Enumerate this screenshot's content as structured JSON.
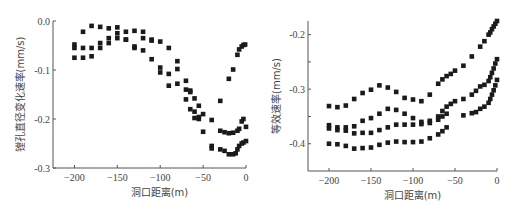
{
  "chart_data": [
    {
      "type": "scatter",
      "title": "",
      "xlabel": "洞口距离(m)",
      "ylabel": "镗孔直径变化速率(mm/s)",
      "xlim": [
        -225,
        0
      ],
      "ylim": [
        -0.3,
        0.0
      ],
      "xticks": [
        -200,
        -150,
        -100,
        -50,
        0
      ],
      "xtick_labels": [
        "-200",
        "-150",
        "-100",
        "-50",
        "0"
      ],
      "yticks": [
        0.0,
        -0.1,
        -0.2,
        -0.3
      ],
      "ytick_labels": [
        "0.0",
        "-0.1",
        "-0.2",
        "-0.3"
      ],
      "grid": false,
      "legend": null,
      "marker": "square",
      "series": [
        {
          "name": "series-1",
          "x": [
            -200,
            -190,
            -180,
            -170,
            -160,
            -150,
            -140,
            -130,
            -120,
            -110,
            -100,
            -90,
            -80,
            -70,
            -65,
            -60,
            -55,
            -50,
            -40,
            -30,
            -20,
            -15,
            -10,
            -8,
            -5,
            -3,
            -1
          ],
          "y": [
            -0.048,
            -0.022,
            -0.01,
            -0.012,
            -0.015,
            -0.013,
            -0.022,
            -0.02,
            -0.022,
            -0.038,
            -0.042,
            -0.055,
            -0.082,
            -0.122,
            -0.142,
            -0.158,
            -0.173,
            -0.19,
            -0.202,
            -0.163,
            -0.118,
            -0.099,
            -0.069,
            -0.058,
            -0.052,
            -0.049,
            -0.048
          ]
        },
        {
          "name": "series-2",
          "x": [
            -200,
            -190,
            -180,
            -170,
            -160,
            -150,
            -140,
            -130,
            -120,
            -110,
            -100,
            -90,
            -80,
            -70,
            -65,
            -60,
            -55,
            -50,
            -40,
            -30,
            -25,
            -20,
            -15,
            -10,
            -8,
            -5,
            -3,
            0
          ],
          "y": [
            -0.055,
            -0.055,
            -0.055,
            -0.045,
            -0.035,
            -0.025,
            -0.038,
            -0.052,
            -0.035,
            -0.04,
            -0.095,
            -0.108,
            -0.098,
            -0.14,
            -0.145,
            -0.185,
            -0.2,
            -0.226,
            -0.255,
            -0.224,
            -0.227,
            -0.229,
            -0.228,
            -0.224,
            -0.22,
            -0.205,
            -0.2,
            -0.216
          ]
        },
        {
          "name": "series-3",
          "x": [
            -200,
            -190,
            -180,
            -170,
            -160,
            -150,
            -140,
            -130,
            -120,
            -110,
            -100,
            -90,
            -80,
            -70,
            -65,
            -60,
            -55,
            -40,
            -30,
            -25,
            -20,
            -15,
            -12,
            -10,
            -8,
            -5,
            -3,
            0
          ],
          "y": [
            -0.075,
            -0.075,
            -0.072,
            -0.055,
            -0.045,
            -0.035,
            -0.038,
            -0.055,
            -0.06,
            -0.078,
            -0.105,
            -0.132,
            -0.128,
            -0.16,
            -0.18,
            -0.198,
            -0.196,
            -0.26,
            -0.262,
            -0.265,
            -0.272,
            -0.272,
            -0.27,
            -0.262,
            -0.255,
            -0.25,
            -0.248,
            -0.245
          ]
        }
      ]
    },
    {
      "type": "scatter",
      "title": "",
      "xlabel": "洞口距离(m)",
      "ylabel": "等效速率(mm/s)",
      "xlim": [
        -225,
        0
      ],
      "ylim": [
        -0.45,
        -0.175
      ],
      "xticks": [
        -200,
        -150,
        -100,
        -50,
        0
      ],
      "xtick_labels": [
        "-200",
        "-150",
        "-100",
        "-50",
        "0"
      ],
      "yticks": [
        -0.2,
        -0.25,
        -0.3,
        -0.35,
        -0.4
      ],
      "ytick_labels": [
        "-0.2",
        "",
        "-0.3",
        "",
        "-0.4"
      ],
      "grid": false,
      "legend": null,
      "marker": "square",
      "series": [
        {
          "name": "series-1",
          "x": [
            -200,
            -190,
            -180,
            -170,
            -160,
            -150,
            -140,
            -130,
            -120,
            -110,
            -100,
            -90,
            -80,
            -70,
            -65,
            -60,
            -55,
            -50,
            -40,
            -30,
            -20,
            -15,
            -10,
            -8,
            -6,
            -4,
            -2,
            0
          ],
          "y": [
            -0.331,
            -0.333,
            -0.33,
            -0.318,
            -0.307,
            -0.301,
            -0.293,
            -0.297,
            -0.305,
            -0.316,
            -0.319,
            -0.322,
            -0.31,
            -0.29,
            -0.282,
            -0.276,
            -0.272,
            -0.266,
            -0.257,
            -0.24,
            -0.222,
            -0.212,
            -0.2,
            -0.196,
            -0.19,
            -0.185,
            -0.18,
            -0.175
          ]
        },
        {
          "name": "series-2",
          "x": [
            -200,
            -190,
            -180,
            -170,
            -160,
            -150,
            -140,
            -130,
            -120,
            -110,
            -100,
            -90,
            -80,
            -70,
            -65,
            -60,
            -55,
            -50,
            -40,
            -30,
            -25,
            -20,
            -15,
            -10,
            -8,
            -6,
            -4,
            -2,
            0
          ],
          "y": [
            -0.366,
            -0.37,
            -0.37,
            -0.368,
            -0.358,
            -0.353,
            -0.345,
            -0.336,
            -0.338,
            -0.345,
            -0.353,
            -0.36,
            -0.358,
            -0.35,
            -0.34,
            -0.332,
            -0.327,
            -0.322,
            -0.318,
            -0.31,
            -0.303,
            -0.295,
            -0.292,
            -0.285,
            -0.278,
            -0.27,
            -0.262,
            -0.253,
            -0.245
          ]
        },
        {
          "name": "series-3",
          "x": [
            -200,
            -190,
            -180,
            -170,
            -160,
            -150,
            -140,
            -130,
            -120,
            -110,
            -100,
            -90,
            -80,
            -70,
            -65,
            -60,
            -40,
            -30,
            -25,
            -20,
            -15,
            -10,
            -8,
            -6,
            -4,
            -2,
            0
          ],
          "y": [
            -0.372,
            -0.375,
            -0.376,
            -0.381,
            -0.38,
            -0.38,
            -0.375,
            -0.37,
            -0.365,
            -0.365,
            -0.365,
            -0.364,
            -0.362,
            -0.356,
            -0.35,
            -0.345,
            -0.348,
            -0.344,
            -0.342,
            -0.336,
            -0.332,
            -0.325,
            -0.318,
            -0.31,
            -0.302,
            -0.293,
            -0.283
          ]
        },
        {
          "name": "series-4",
          "x": [
            -200,
            -190,
            -180,
            -170,
            -160,
            -150,
            -140,
            -130,
            -120,
            -110,
            -100,
            -90,
            -80,
            -70,
            -65,
            -60
          ],
          "y": [
            -0.4,
            -0.401,
            -0.404,
            -0.409,
            -0.408,
            -0.407,
            -0.402,
            -0.398,
            -0.396,
            -0.397,
            -0.397,
            -0.396,
            -0.39,
            -0.383,
            -0.377,
            -0.37
          ]
        }
      ]
    }
  ]
}
